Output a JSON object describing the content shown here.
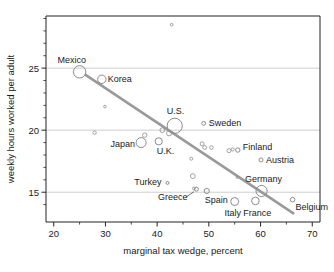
{
  "chart_data": {
    "type": "scatter",
    "title": "",
    "xlabel": "marginal tax wedge, percent",
    "ylabel": "weekly hours worked per adult",
    "xlim": [
      18.5,
      71.5
    ],
    "ylim": [
      12.6,
      29.2
    ],
    "xticks": [
      20,
      30,
      40,
      50,
      60,
      70
    ],
    "xtick_labels": [
      "20",
      "30",
      "40",
      "50",
      "60",
      "70"
    ],
    "xminor_ticks": [
      25,
      35,
      45,
      55,
      65
    ],
    "yticks": [
      15,
      20,
      25
    ],
    "ytick_labels": [
      "15",
      "20",
      "25"
    ],
    "yminor_ticks": [
      14,
      16,
      17,
      18,
      19,
      21,
      22,
      23,
      24,
      26,
      27,
      28,
      29
    ],
    "grid": "horizontal",
    "legend": "none",
    "marker_style": "open-circle-bubble",
    "accent_color": "#8c8c8c",
    "line_color": "#9a9a9a",
    "axis_color": "#222222",
    "grid_color": "#b8b8b8",
    "trendline": {
      "label": "fitted regression line",
      "x": [
        26.0,
        66.5
      ],
      "y": [
        24.5,
        13.25
      ]
    },
    "points": [
      {
        "label": "Mexico",
        "x": 25.0,
        "y": 24.7,
        "size": 6.2
      },
      {
        "label": "Korea",
        "x": 29.3,
        "y": 24.1,
        "size": 4.2
      },
      {
        "label": "U.S.",
        "x": 43.4,
        "y": 20.35,
        "size": 7.6
      },
      {
        "label": "Sweden",
        "x": 49.0,
        "y": 20.55,
        "size": 1.9
      },
      {
        "label": "Japan",
        "x": 36.9,
        "y": 19.0,
        "size": 5.0
      },
      {
        "label": "U.K.",
        "x": 40.3,
        "y": 19.1,
        "size": 3.6
      },
      {
        "label": "Finland",
        "x": 55.6,
        "y": 18.4,
        "size": 2.2
      },
      {
        "label": "Austria",
        "x": 60.1,
        "y": 17.6,
        "size": 2.0
      },
      {
        "label": "Turkey",
        "x": 42.0,
        "y": 15.75,
        "size": 1.5
      },
      {
        "label": "Greece",
        "x": 47.6,
        "y": 15.25,
        "size": 2.0
      },
      {
        "label": "Spain",
        "x": 49.6,
        "y": 15.1,
        "size": 2.6
      },
      {
        "label": "Italy",
        "x": 55.0,
        "y": 14.25,
        "size": 4.0
      },
      {
        "label": "France",
        "x": 59.0,
        "y": 14.3,
        "size": 3.8
      },
      {
        "label": "Germany",
        "x": 60.2,
        "y": 15.1,
        "size": 5.6
      },
      {
        "label": "Belgium",
        "x": 66.2,
        "y": 14.4,
        "size": 2.3
      }
    ],
    "unlabeled_points": [
      {
        "x": 42.8,
        "y": 28.5,
        "size": 1.3
      },
      {
        "x": 29.9,
        "y": 21.9,
        "size": 1.3
      },
      {
        "x": 27.9,
        "y": 19.8,
        "size": 1.7
      },
      {
        "x": 37.6,
        "y": 19.6,
        "size": 2.2
      },
      {
        "x": 41.0,
        "y": 20.0,
        "size": 2.4
      },
      {
        "x": 42.3,
        "y": 19.75,
        "size": 2.6
      },
      {
        "x": 48.7,
        "y": 18.9,
        "size": 2.0
      },
      {
        "x": 49.2,
        "y": 18.6,
        "size": 1.9
      },
      {
        "x": 50.5,
        "y": 18.6,
        "size": 1.8
      },
      {
        "x": 53.9,
        "y": 18.35,
        "size": 2.0
      },
      {
        "x": 54.6,
        "y": 18.45,
        "size": 1.6
      },
      {
        "x": 46.6,
        "y": 17.7,
        "size": 1.5
      },
      {
        "x": 46.9,
        "y": 16.3,
        "size": 2.4
      },
      {
        "x": 55.5,
        "y": 16.2,
        "size": 1.2
      },
      {
        "x": 47.1,
        "y": 15.3,
        "size": 1.4
      }
    ],
    "label_offsets": {
      "Mexico": {
        "dx": -22,
        "dy": -9,
        "anchor": "start"
      },
      "Korea": {
        "dx": 6,
        "dy": 3,
        "anchor": "start"
      },
      "U.S.": {
        "dx": -8,
        "dy": -12,
        "anchor": "start"
      },
      "Sweden": {
        "dx": 5,
        "dy": 3,
        "anchor": "start"
      },
      "Japan": {
        "dx": -6,
        "dy": 4,
        "anchor": "end"
      },
      "U.K.": {
        "dx": -2,
        "dy": 13,
        "anchor": "start"
      },
      "Finland": {
        "dx": 5,
        "dy": 0,
        "anchor": "start"
      },
      "Austria": {
        "dx": 5,
        "dy": 3,
        "anchor": "start"
      },
      "Turkey": {
        "dx": -6,
        "dy": 2,
        "anchor": "end"
      },
      "Greece": {
        "dx": -9,
        "dy": 11,
        "anchor": "end"
      },
      "Spain": {
        "dx": -2,
        "dy": 12,
        "anchor": "start"
      },
      "Italy": {
        "dx": -2,
        "dy": 14,
        "anchor": "middle"
      },
      "France": {
        "dx": 2,
        "dy": 15,
        "anchor": "middle"
      },
      "Germany": {
        "dx": 2,
        "dy": -9,
        "anchor": "middle"
      },
      "Belgium": {
        "dx": 3,
        "dy": 10,
        "anchor": "start"
      }
    }
  }
}
